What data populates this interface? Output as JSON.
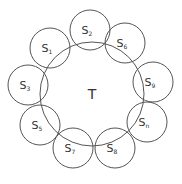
{
  "diagram": {
    "center": {
      "label": "T",
      "cx": 92,
      "cy": 94,
      "r": 52
    },
    "satellites": [
      {
        "base": "S",
        "sub": "2",
        "cx": 90,
        "cy": 30
      },
      {
        "base": "S",
        "sub": "1",
        "cx": 50,
        "cy": 48
      },
      {
        "base": "S",
        "sub": "6",
        "cx": 125,
        "cy": 43
      },
      {
        "base": "S",
        "sub": "3",
        "cx": 28,
        "cy": 85
      },
      {
        "base": "S",
        "sub": "9",
        "cx": 153,
        "cy": 82
      },
      {
        "base": "S",
        "sub": "5",
        "cx": 40,
        "cy": 125
      },
      {
        "base": "S",
        "sub": "n",
        "cx": 147,
        "cy": 122
      },
      {
        "base": "S",
        "sub": "7",
        "cx": 73,
        "cy": 148
      },
      {
        "base": "S",
        "sub": "8",
        "cx": 115,
        "cy": 148
      }
    ],
    "satellite_radius": 20,
    "stroke_color": "#555555"
  }
}
